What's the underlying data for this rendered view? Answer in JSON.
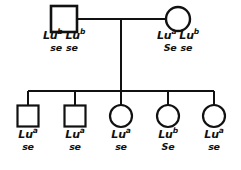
{
  "diagram": {
    "type": "pedigree-chart",
    "generations": 2,
    "colors": {
      "line": "#111111",
      "background": "#ffffff",
      "text": "#111111"
    }
  },
  "parents": [
    {
      "id": "father",
      "sex": "male",
      "symbol": "square",
      "cx": 64,
      "cy": 19,
      "size": 26,
      "label": {
        "gene_alleles": [
          {
            "base": "Lu",
            "sup": "b"
          },
          {
            "base": "Lu",
            "sup": "b"
          }
        ],
        "secretor_alleles": [
          "se",
          "se"
        ],
        "x": 16,
        "y": 30
      }
    },
    {
      "id": "mother",
      "sex": "female",
      "symbol": "circle",
      "cx": 178,
      "cy": 19,
      "radius": 12,
      "label": {
        "gene_alleles": [
          {
            "base": "Lu",
            "sup": "a"
          },
          {
            "base": "Lu",
            "sup": "b"
          }
        ],
        "secretor_alleles": [
          "Se",
          "se"
        ],
        "x": 130,
        "y": 30
      }
    }
  ],
  "mating": {
    "line_y": 19,
    "x_start": 77,
    "x_end": 166,
    "descent_x": 121,
    "descent_y_start": 19,
    "descent_y_end": 91
  },
  "sibship": {
    "line_y": 91,
    "x_start": 28,
    "x_end": 214,
    "drop_y_end": 106
  },
  "children": [
    {
      "id": "child-1",
      "sex": "male",
      "symbol": "square",
      "cx": 28,
      "cy": 116,
      "size": 21,
      "label": {
        "gene_alleles": [
          {
            "base": "Lu",
            "sup": "a"
          }
        ],
        "secretor_alleles": [
          "se"
        ],
        "x": 5,
        "y": 129
      }
    },
    {
      "id": "child-2",
      "sex": "male",
      "symbol": "square",
      "cx": 75,
      "cy": 116,
      "size": 21,
      "label": {
        "gene_alleles": [
          {
            "base": "Lu",
            "sup": "a"
          }
        ],
        "secretor_alleles": [
          "se"
        ],
        "x": 52,
        "y": 129
      }
    },
    {
      "id": "child-3",
      "sex": "female",
      "symbol": "circle",
      "cx": 121,
      "cy": 116,
      "radius": 11,
      "label": {
        "gene_alleles": [
          {
            "base": "Lu",
            "sup": "a"
          }
        ],
        "secretor_alleles": [
          "se"
        ],
        "x": 98,
        "y": 129
      }
    },
    {
      "id": "child-4",
      "sex": "female",
      "symbol": "circle",
      "cx": 168,
      "cy": 116,
      "radius": 11,
      "label": {
        "gene_alleles": [
          {
            "base": "Lu",
            "sup": "b"
          }
        ],
        "secretor_alleles": [
          "Se"
        ],
        "x": 145,
        "y": 129
      }
    },
    {
      "id": "child-5",
      "sex": "female",
      "symbol": "circle",
      "cx": 214,
      "cy": 116,
      "radius": 11,
      "label": {
        "gene_alleles": [
          {
            "base": "Lu",
            "sup": "a"
          }
        ],
        "secretor_alleles": [
          "se"
        ],
        "x": 191,
        "y": 129
      }
    }
  ]
}
